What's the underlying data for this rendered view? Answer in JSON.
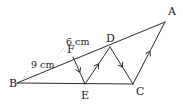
{
  "figure": {
    "background_color": "#ffffff",
    "line_color": "#2b2b2b",
    "leader_color": "#9a9a9a",
    "text_color": "#1a1a1a"
  },
  "vertices": [
    {
      "id": "A",
      "label": "A",
      "x": 165,
      "y": 22,
      "label_x": 168,
      "label_y": 15
    },
    {
      "id": "B",
      "label": "B",
      "x": 17,
      "y": 83,
      "label_x": 9,
      "label_y": 87
    },
    {
      "id": "C",
      "label": "C",
      "x": 133,
      "y": 84,
      "label_x": 136,
      "label_y": 95
    },
    {
      "id": "D",
      "label": "D",
      "x": 110,
      "y": 47,
      "label_x": 106,
      "label_y": 42
    },
    {
      "id": "E",
      "label": "E",
      "x": 85,
      "y": 84,
      "label_x": 81,
      "label_y": 99
    },
    {
      "id": "F",
      "label": "F",
      "x": 73,
      "y": 57,
      "label_x": 67,
      "label_y": 53
    }
  ],
  "segments": [
    {
      "id": "BA",
      "from": "B",
      "to": "A",
      "ticks": 0
    },
    {
      "id": "BC",
      "from": "B",
      "to": "C",
      "ticks": 0
    },
    {
      "id": "FE",
      "from": "F",
      "to": "E",
      "ticks": 1
    },
    {
      "id": "ED",
      "from": "E",
      "to": "D",
      "ticks": 1
    },
    {
      "id": "DC",
      "from": "D",
      "to": "C",
      "ticks": 1
    },
    {
      "id": "CA",
      "from": "C",
      "to": "A",
      "ticks": 1
    }
  ],
  "measurements": [
    {
      "id": "BF",
      "text": "9 cm",
      "segment": "B-F",
      "label_x": 31,
      "label_y": 68,
      "leader_from_x": 28,
      "leader_from_y": 71,
      "leader_to_x": 22,
      "leader_to_y": 80
    },
    {
      "id": "FD",
      "text": "6 cm",
      "segment": "F-D",
      "label_x": 66,
      "label_y": 45,
      "leader_from_x": 64,
      "leader_from_y": 48,
      "leader_to_x": 57,
      "leader_to_y": 56
    }
  ],
  "chart_data": {
    "type": "diagram",
    "points": {
      "A": [
        165,
        22
      ],
      "B": [
        17,
        83
      ],
      "C": [
        133,
        84
      ],
      "D": [
        110,
        47
      ],
      "E": [
        85,
        84
      ],
      "F": [
        73,
        57
      ]
    },
    "edges": [
      "B-A",
      "B-C",
      "F-E",
      "E-D",
      "D-C",
      "C-A"
    ],
    "collinear": [
      "B-F-D-A",
      "B-E-C"
    ],
    "labeled_lengths": {
      "BF": "9 cm",
      "FD": "6 cm"
    },
    "parallel_marks": {
      "single_arrow": [
        "F-E",
        "E-D",
        "D-C",
        "C-A"
      ]
    }
  }
}
